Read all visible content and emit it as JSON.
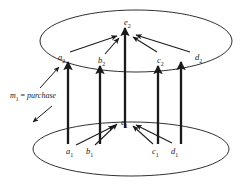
{
  "diagram": {
    "stroke_color": "#1a1a1a",
    "background_color": "#ffffff",
    "levels": [
      {
        "name": "upper-level",
        "ellipse": {
          "cx": 136,
          "cy": 41,
          "rx": 96,
          "ry": 31
        },
        "center_node": {
          "id": "e2",
          "var": "e",
          "sub": "2",
          "x": 124,
          "y": 18
        },
        "nodes": [
          {
            "id": "a2",
            "var": "a",
            "sub": "2",
            "x": 58,
            "y": 53
          },
          {
            "id": "b2",
            "var": "b",
            "sub": "2",
            "x": 98,
            "y": 56
          },
          {
            "id": "c2",
            "var": "c",
            "sub": "2",
            "x": 157,
            "y": 56
          },
          {
            "id": "d2",
            "var": "d",
            "sub": "2",
            "x": 195,
            "y": 53
          }
        ]
      },
      {
        "name": "lower-level",
        "ellipse": {
          "cx": 131,
          "cy": 149,
          "rx": 98,
          "ry": 27
        },
        "center_node": {
          "id": "e1",
          "var": "e",
          "sub": "1",
          "x": 121,
          "y": 118
        },
        "nodes": [
          {
            "id": "a1",
            "var": "a",
            "sub": "1",
            "x": 66,
            "y": 147
          },
          {
            "id": "b1",
            "var": "b",
            "sub": "1",
            "x": 86,
            "y": 147
          },
          {
            "id": "c1",
            "var": "c",
            "sub": "1",
            "x": 152,
            "y": 147
          },
          {
            "id": "d1",
            "var": "d",
            "sub": "1",
            "x": 171,
            "y": 147
          }
        ]
      }
    ],
    "morphism": {
      "name": "morphism-annotation",
      "var": "m",
      "sub": "1",
      "equals": " = ",
      "value": "purchase",
      "x": 10,
      "y": 92
    }
  }
}
